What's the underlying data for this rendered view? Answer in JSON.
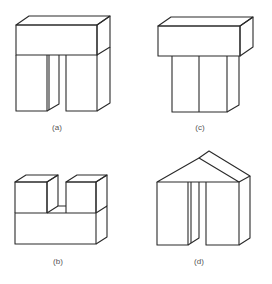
{
  "figures": [
    {
      "id": "a",
      "label": "(a)",
      "description": "Horizontal slab resting on two separated upright blocks"
    },
    {
      "id": "c",
      "label": "(c)",
      "description": "Horizontal slab resting on two adjacent upright blocks"
    },
    {
      "id": "b",
      "label": "(b)",
      "description": "Two cubes placed on top of a horizontal slab with gap between them"
    },
    {
      "id": "d",
      "label": "(d)",
      "description": "Triangular prism roof resting on two separated upright blocks"
    }
  ],
  "colors": {
    "line": "#2a2a2a",
    "label": "#555555",
    "background": "#ffffff"
  }
}
